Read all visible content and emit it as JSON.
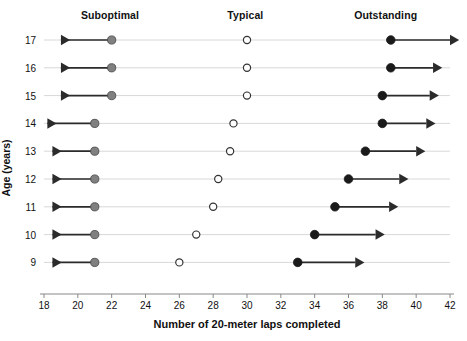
{
  "chart_data": {
    "type": "scatter",
    "title": "",
    "xlabel": "Number of 20-meter laps completed",
    "ylabel": "Age (years)",
    "xlim": [
      18,
      42
    ],
    "ylim": [
      8.5,
      17.5
    ],
    "xticks": [
      18,
      20,
      22,
      24,
      26,
      28,
      30,
      32,
      34,
      36,
      38,
      40,
      42
    ],
    "yticks": [
      9,
      10,
      11,
      12,
      13,
      14,
      15,
      16,
      17
    ],
    "grid": false,
    "zone_headers": [
      {
        "label": "Suboptimal",
        "x": 21.9
      },
      {
        "label": "Typical",
        "x": 29.9
      },
      {
        "label": "Outstanding",
        "x": 38.2
      }
    ],
    "legend_position": "top",
    "series": [
      {
        "name": "Suboptimal threshold",
        "marker": "filled-gray-circle",
        "color": "#808080",
        "arrow": "left",
        "categories": [
          17,
          16,
          15,
          14,
          13,
          12,
          11,
          10,
          9
        ],
        "values": [
          22.0,
          22.0,
          22.0,
          21.0,
          21.0,
          21.0,
          21.0,
          21.0,
          21.0
        ]
      },
      {
        "name": "Typical",
        "marker": "open-circle",
        "color": "#ffffff",
        "arrow": "none",
        "categories": [
          17,
          16,
          15,
          14,
          13,
          12,
          11,
          10,
          9
        ],
        "values": [
          30.0,
          30.0,
          30.0,
          29.2,
          29.0,
          28.3,
          28.0,
          27.0,
          26.0
        ]
      },
      {
        "name": "Outstanding threshold",
        "marker": "filled-black-circle",
        "color": "#1a1a1a",
        "arrow": "right",
        "categories": [
          17,
          16,
          15,
          14,
          13,
          12,
          11,
          10,
          9
        ],
        "values": [
          38.5,
          38.5,
          38.0,
          38.0,
          37.0,
          36.0,
          35.2,
          34.0,
          33.0
        ]
      }
    ],
    "arrow_extents": {
      "left_end": [
        19.0,
        19.0,
        19.0,
        18.2,
        18.5,
        18.5,
        18.5,
        18.5,
        18.5
      ],
      "right_end": [
        42.0,
        41.0,
        40.8,
        40.6,
        40.0,
        39.0,
        38.4,
        37.6,
        36.4
      ]
    },
    "row_lines": {
      "color": "#d8d8d8",
      "x_start": 18.0,
      "x_end": 42.0
    }
  },
  "colors": {
    "suboptimal_marker": "#808080",
    "typical_marker_stroke": "#333333",
    "typical_marker_fill": "#ffffff",
    "outstanding_marker": "#1a1a1a",
    "arrow": "#2b2b2b",
    "row_line": "#d8d8d8",
    "axis": "#888888",
    "text": "#111111"
  }
}
